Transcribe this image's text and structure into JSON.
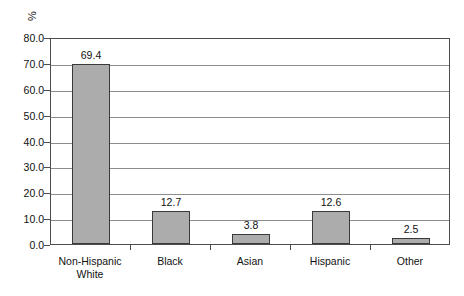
{
  "chart_data": {
    "type": "bar",
    "title": "",
    "xlabel": "",
    "ylabel": "%",
    "ylim": [
      0,
      80
    ],
    "ytick_step": 10,
    "grid": true,
    "legend": "none",
    "categories": [
      "Non-Hispanic White",
      "Black",
      "Asian",
      "Hispanic",
      "Other"
    ],
    "category_lines": [
      [
        "Non-Hispanic",
        "White"
      ],
      [
        "Black"
      ],
      [
        "Asian"
      ],
      [
        "Hispanic"
      ],
      [
        "Other"
      ]
    ],
    "values": [
      69.4,
      12.7,
      3.8,
      12.6,
      2.5
    ],
    "value_labels": [
      "69.4",
      "12.7",
      "3.8",
      "12.6",
      "2.5"
    ],
    "ytick_labels": [
      "80.0",
      "70.0",
      "60.0",
      "50.0",
      "40.0",
      "30.0",
      "20.0",
      "10.0",
      "0.0"
    ],
    "ytick_values": [
      80,
      70,
      60,
      50,
      40,
      30,
      20,
      10,
      0
    ]
  },
  "colors": {
    "bar_fill": "#acacac",
    "bar_border": "#3a3a3a",
    "gridline": "#8c8c8c",
    "frame": "#4d4d4d",
    "background": "#ffffff",
    "text": "#111111"
  }
}
